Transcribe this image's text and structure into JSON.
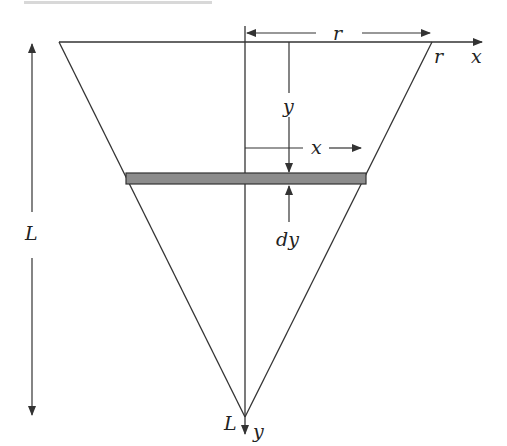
{
  "diagram": {
    "type": "inverted-cone-cross-section",
    "colors": {
      "line": "#333333",
      "strip_fill": "#8c8c8c",
      "background": "#ffffff",
      "top_bar": "#d8d8d8"
    },
    "labels": {
      "radius_top": "r",
      "radius_corner": "r",
      "x_axis": "x",
      "y_depth": "y",
      "x_width": "x",
      "dy": "dy",
      "length": "L",
      "apex_L": "L",
      "y_axis": "y"
    }
  }
}
